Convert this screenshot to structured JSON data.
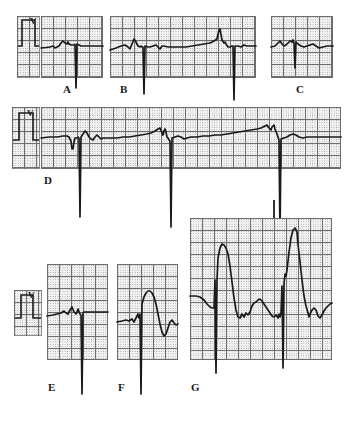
{
  "figure": {
    "kind": "ecg-rhythm-strip-figure",
    "width": 355,
    "height": 434,
    "background_color": "#ffffff",
    "grid_color": "#9a9a9a",
    "grid_major_color": "#6e6e6e",
    "grid_fill_color": "#f2f2f2",
    "trace_color": "#1a1a1a",
    "calibration_label": "V"
  },
  "panels": [
    {
      "id": "A",
      "label": "A",
      "row": 1,
      "x": 41,
      "y": 16,
      "w": 62,
      "h": 62,
      "label_x": 63,
      "label_y": 84,
      "description": "Short ECG strip with single deep negative pacing spike",
      "beats": 1,
      "spike_direction": "down"
    },
    {
      "id": "B",
      "label": "B",
      "row": 1,
      "x": 110,
      "y": 16,
      "w": 146,
      "h": 62,
      "label_x": 120,
      "label_y": 84,
      "description": "Long ECG strip with two deep negative pacing spikes and intrinsic beats",
      "beats": 3,
      "spike_direction": "down"
    },
    {
      "id": "C",
      "label": "C",
      "row": 1,
      "x": 271,
      "y": 16,
      "w": 62,
      "h": 62,
      "label_x": 296,
      "label_y": 84,
      "description": "Short ECG strip with one moderate negative spike",
      "beats": 1,
      "spike_direction": "down"
    },
    {
      "id": "D",
      "label": "D",
      "row": 2,
      "x": 41,
      "y": 107,
      "w": 300,
      "h": 62,
      "label_x": 44,
      "label_y": 175,
      "description": "Wide rhythm strip, three very deep negative pacing spikes extending below panel",
      "beats": 3,
      "spike_direction": "down"
    },
    {
      "id": "E",
      "label": "E",
      "row": 3,
      "x": 47,
      "y": 264,
      "w": 61,
      "h": 96,
      "label_x": 48,
      "label_y": 382,
      "description": "Panel with flat baseline and one very deep negative pacing spike",
      "beats": 1,
      "spike_direction": "down"
    },
    {
      "id": "F",
      "label": "F",
      "row": 3,
      "x": 117,
      "y": 264,
      "w": 61,
      "h": 96,
      "label_x": 118,
      "label_y": 382,
      "description": "Panel with deep spike followed by broad positive paced complex",
      "beats": 1,
      "spike_direction": "down"
    },
    {
      "id": "G",
      "label": "G",
      "row": 3,
      "x": 190,
      "y": 218,
      "w": 142,
      "h": 142,
      "label_x": 191,
      "label_y": 382,
      "description": "Large panel with two tall positive paced QRS complexes and deep negative pacing spikes",
      "beats": 2,
      "spike_direction": "down"
    }
  ],
  "calibration_markers": [
    {
      "id": "cal-1",
      "x": 17,
      "y": 16,
      "w": 23,
      "h": 62,
      "pulse_label": "V"
    },
    {
      "id": "cal-2",
      "x": 12,
      "y": 107,
      "w": 28,
      "h": 62,
      "pulse_label": "V"
    },
    {
      "id": "cal-3",
      "x": 14,
      "y": 290,
      "w": 28,
      "h": 46,
      "pulse_label": "V"
    }
  ],
  "chart_data": {
    "type": "line",
    "title": "",
    "xlabel": "",
    "ylabel": "",
    "grid": true,
    "legend": "none",
    "series": [
      {
        "name": "A",
        "points": "M0,32 L5,31.5 L9,31 L12,30 L14,32 L16,31 L18,30 L20,27 L22,25 L24,27 L26,28 L27,26 L28,28 L30,29 L31,29 L33,29 L34,28.5 L35,72 L36,28 L38,29 L40,30 L44,30 L50,30 L56,30 L62,30"
      },
      {
        "name": "B",
        "points": "M0,34 L6,32 L11,30 L15,29 L18,31 L20,33 L22,28 L24,23 L26,26 L28,30 L30,31 L31,30 L32,31 L33,31 L34,78 L35,30 L38,31 L40,31 L43,30 L46,29 L48,31 L50,33 L52,30 L54,30 L58,31 L64,31 L70,31 L76,31 L82,30 L88,29 L94,28 L100,27 L104,25 L107,23 L109,14 L110,13 L112,24 L114,27 L115,26 L116,28 L118,31 L120,31 L122,30 L123,30 L124,84 L125,30 L128,30 L131,31 L134,29 L137,30 L140,30 L146,30"
      },
      {
        "name": "C",
        "points": "M0,31 L4,30 L7,27 L9,25 L11,28 L13,30 L15,29 L17,27 L19,25 L21,26 L22,24 L23,27 L24,52 L25,26 L27,28 L30,30 L33,31 L36,30 L39,29 L42,28 L45,30 L48,32 L52,31 L56,30 L62,30"
      },
      {
        "name": "D",
        "points": "M0,31 L8,30 L16,30 L22,29 L26,29 L28,30 L30,34 L31,42 L32,42 L33,35 L34,31 L36,31 L37,30 L38,31 L39,110 L40,30 L42,27 L44,24 L46,26 L48,30 L50,32 L52,33 L54,30 L56,28 L58,30 L60,32 L62,31 L66,31 L70,31 L76,31 L82,30 L88,30 L94,29 L100,28 L106,27 L110,26 L114,24 L117,22 L119,21 L121,26 L122,28 L123,24 L124,22 L125,25 L126,30 L127,31 L128,33 L129,34 L130,120 L131,31 L134,30 L137,29 L140,30 L143,32 L146,31 L150,30 L156,30 L162,29 L168,29 L174,28 L180,28 L186,27 L192,26 L198,25 L204,24 L210,23 L216,22 L220,21 L224,19 L226,18 L228,21 L230,23 L231,20 L233,18 L234,22 L236,27 L237,30 L238,33 L239,130 L240,32 L243,31 L246,30 L249,28 L252,27 L255,28 L258,30 L262,31 L266,30 L270,30 L276,30 L282,30 L290,30 L300,30"
      },
      {
        "name": "E",
        "points": "M0,52 L6,51 L10,50 L14,49 L17,47 L19,49 L21,50 L23,46 L25,43 L27,48 L29,50 L30,48 L31,45 L32,48 L33,50 L34,51 L35,130 L36,49 L37,48 L40,48 L44,48 L50,48 L56,48 L61,48"
      },
      {
        "name": "F",
        "points": "M0,58 L5,57 L9,56 L12,57 L15,55 L17,58 L19,54 L21,50 L22,54 L23,50 L24,130 L25,40 L27,33 L29,29 L31,27 L33,27 L35,29 L37,33 L39,40 L41,50 L43,60 L45,68 L47,72 L49,70 L51,64 L53,58 L55,56 L57,59 L59,61 L61,60"
      },
      {
        "name": "G",
        "points": "M0,78 L6,78 L10,79 L14,82 L17,86 L20,89 L22,90 L24,90 L25,62 L26,155 L27,62 L28,40 L30,30 L32,26 L34,27 L36,30 L38,36 L40,48 L42,64 L44,80 L46,92 L48,99 L50,100 L52,96 L54,99 L56,95 L58,97 L60,94 L62,88 L64,85 L66,84 L68,82 L70,81 L72,83 L74,86 L76,89 L78,92 L80,95 L82,98 L84,99 L86,97 L88,100 L89,96 L90,99 L91,95 L92,68 L93,150 L94,66 L95,56 L96,58 L97,52 L99,34 L101,20 L103,12 L105,10 L107,14 L108,26 L110,44 L112,62 L114,78 L116,88 L118,95 L119,99 L120,96 L122,92 L124,90 L126,92 L128,98 L130,100 L132,97 L134,93 L136,90 L138,88 L140,86 L142,85"
      }
    ]
  }
}
